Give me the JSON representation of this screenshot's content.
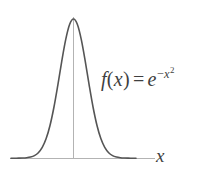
{
  "figure": {
    "background_color": "#ffffff",
    "width": 224,
    "height": 175
  },
  "labels": {
    "formula_plain": "f(x) = e^{-x^2}",
    "formula_fn": "f",
    "formula_open_paren": "(",
    "formula_var": "x",
    "formula_close_paren": ")",
    "formula_equals": "=",
    "formula_base": "e",
    "formula_exp_minus": "−",
    "formula_exp_var": "x",
    "formula_exp_power": "2",
    "x_axis_label": "x"
  },
  "colors": {
    "curve": "#555555",
    "axis": "#b0b0b0",
    "text": "#3f3f3f",
    "background": "#ffffff"
  },
  "chart_data": {
    "type": "line",
    "title": "",
    "subtitle": "",
    "xlabel": "x",
    "ylabel": "",
    "annotations": [
      "f(x) = e^{-x^2}"
    ],
    "legend": [],
    "legend_position": "none",
    "grid": false,
    "xlim": [
      -3.2,
      3.2
    ],
    "ylim": [
      0,
      1.05
    ],
    "xticks": [],
    "yticks": [],
    "axis_lines": {
      "x_axis": {
        "y": 0,
        "x_start": -3.2,
        "x_end": 2.95
      },
      "y_axis": {
        "x": 0,
        "y_start": 0,
        "y_end": 1.02
      }
    },
    "series": [
      {
        "name": "f(x) = e^{-x^2}",
        "color": "#555555",
        "linewidth": 1.6,
        "x": [
          -3.2,
          -3.0,
          -2.8,
          -2.6,
          -2.4,
          -2.2,
          -2.0,
          -1.8,
          -1.6,
          -1.4,
          -1.2,
          -1.0,
          -0.8,
          -0.6,
          -0.4,
          -0.2,
          0.0,
          0.2,
          0.4,
          0.6,
          0.8,
          1.0,
          1.2,
          1.4,
          1.6,
          1.8,
          2.0,
          2.2,
          2.4,
          2.6,
          2.8,
          3.0,
          3.2
        ],
        "values": [
          0.0,
          0.0001,
          0.0003,
          0.0012,
          0.0032,
          0.0079,
          0.0183,
          0.0392,
          0.0773,
          0.1409,
          0.2369,
          0.3679,
          0.5273,
          0.6977,
          0.8521,
          0.9608,
          1.0,
          0.9608,
          0.8521,
          0.6977,
          0.5273,
          0.3679,
          0.2369,
          0.1409,
          0.0773,
          0.0392,
          0.0183,
          0.0079,
          0.0032,
          0.0012,
          0.0003,
          0.0001,
          0.0
        ]
      }
    ],
    "peak": {
      "x": 0,
      "y": 1.0
    }
  }
}
